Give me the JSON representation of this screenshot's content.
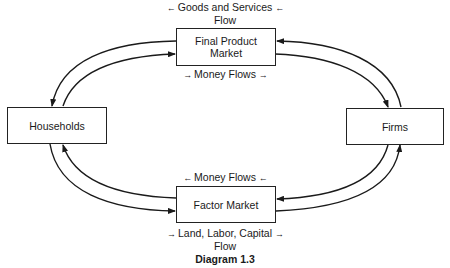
{
  "title": "Diagram 1.3",
  "nodes": {
    "final_product_market": {
      "line1": "Final Product",
      "line2": "Market"
    },
    "factor_market": {
      "label": "Factor Market"
    },
    "households": {
      "label": "Households"
    },
    "firms": {
      "label": "Firms"
    }
  },
  "flow_labels": {
    "goods_services": {
      "line1": "Goods and Services",
      "line2": "Flow",
      "arrow_left": "←",
      "arrow_right": "←"
    },
    "money_top": {
      "text": "Money Flows",
      "arrow_left": "→",
      "arrow_right": "→"
    },
    "money_bottom": {
      "text": "Money Flows",
      "arrow_left": "←",
      "arrow_right": "←"
    },
    "land_labor_capital": {
      "line1": "Land, Labor, Capital",
      "line2": "Flow",
      "arrow_left": "→",
      "arrow_right": "→"
    }
  },
  "colors": {
    "line": "#1a1a1a",
    "background": "#ffffff"
  }
}
